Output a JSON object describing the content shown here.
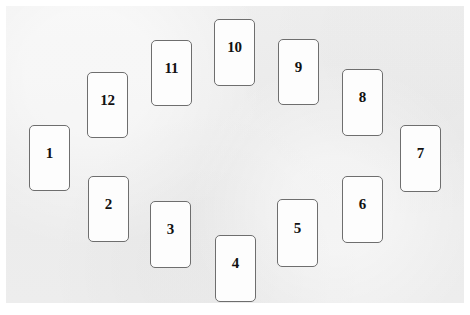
{
  "scene": {
    "title": "Card Layout",
    "description": "Twelve numbered rectangular cards arranged in an oval ring on a light gray surface",
    "canvas": {
      "width": 470,
      "height": 315
    },
    "board": {
      "x": 6,
      "y": 6,
      "width": 458,
      "height": 297,
      "background_color": "#ececec"
    },
    "card_style": {
      "face_color": "#fdfdfd",
      "border_color": "#6e6e6e",
      "text_color": "#111111",
      "corner_radius": 5
    },
    "card_count": 12
  },
  "cards": [
    {
      "label": "1",
      "x": 29,
      "y": 125,
      "width": 41,
      "height": 66
    },
    {
      "label": "2",
      "x": 88,
      "y": 176,
      "width": 41,
      "height": 66
    },
    {
      "label": "3",
      "x": 150,
      "y": 201,
      "width": 41,
      "height": 67
    },
    {
      "label": "4",
      "x": 215,
      "y": 235,
      "width": 41,
      "height": 67
    },
    {
      "label": "5",
      "x": 277,
      "y": 199,
      "width": 41,
      "height": 68
    },
    {
      "label": "6",
      "x": 342,
      "y": 176,
      "width": 41,
      "height": 67
    },
    {
      "label": "7",
      "x": 400,
      "y": 125,
      "width": 41,
      "height": 67
    },
    {
      "label": "8",
      "x": 342,
      "y": 69,
      "width": 41,
      "height": 67
    },
    {
      "label": "9",
      "x": 278,
      "y": 39,
      "width": 41,
      "height": 66
    },
    {
      "label": "10",
      "x": 214,
      "y": 19,
      "width": 41,
      "height": 67
    },
    {
      "label": "11",
      "x": 151,
      "y": 40,
      "width": 41,
      "height": 66
    },
    {
      "label": "12",
      "x": 87,
      "y": 72,
      "width": 41,
      "height": 66
    }
  ]
}
